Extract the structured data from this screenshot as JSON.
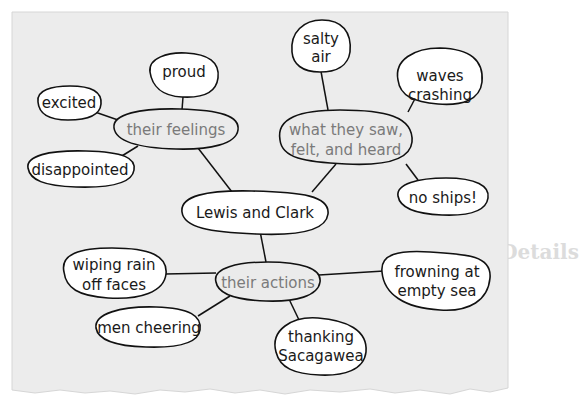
{
  "diagram": {
    "type": "concept-web",
    "center": {
      "id": "center",
      "label": "Lewis and Clark"
    },
    "categories": [
      {
        "id": "feelings",
        "label": "their feelings",
        "details": [
          "proud",
          "excited",
          "disappointed"
        ]
      },
      {
        "id": "senses",
        "label": [
          "what they saw,",
          "felt, and heard"
        ],
        "details": [
          [
            "salty",
            "air"
          ],
          [
            "waves",
            "crashing"
          ],
          [
            "no ships!"
          ]
        ]
      },
      {
        "id": "actions",
        "label": "their actions",
        "details": [
          [
            "wiping rain",
            "off faces"
          ],
          [
            "men cheering"
          ],
          [
            "thanking",
            "Sacagawea"
          ],
          [
            "frowning at",
            "empty sea"
          ]
        ]
      }
    ]
  },
  "colors": {
    "paper": "#ececec",
    "page_background": "#ffffff",
    "ink": "#111111",
    "category_text": "#7a7a7a",
    "ghost_text": "#d9d9d9"
  },
  "background_text": {
    "line1": "Thomas Jefferson / Declaration of Independence",
    "heading": "Gathering Details"
  }
}
